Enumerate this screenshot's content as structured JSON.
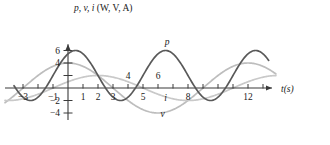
{
  "chart_data": {
    "type": "line",
    "title": "p, v, i (W, V, A)",
    "xlabel": "t(s)",
    "ylabel": "p, v, i (W, V, A)",
    "xlim": [
      -4,
      14
    ],
    "ylim": [
      -5.2,
      7.2
    ],
    "grid": false,
    "legend_position": "inline-curve-labels",
    "xticks": [
      -3,
      -2,
      -1,
      0,
      1,
      2,
      3,
      4,
      5,
      6,
      7,
      8,
      9,
      10,
      11,
      12,
      13
    ],
    "xticklabels_shown": [
      "-3",
      "-1",
      "1",
      "2",
      "3",
      "4",
      "5",
      "6",
      "8",
      "12"
    ],
    "yticks": [
      -4,
      -2,
      2,
      4,
      6
    ],
    "yticklabels_shown": [
      "6",
      "4",
      "-2",
      "-4"
    ],
    "series": [
      {
        "name": "p",
        "label": "p",
        "unit": "W",
        "color": "#595959",
        "style": "dark-solid",
        "form": "p = 2 + 4*sin(2*pi*(t+1)/6)",
        "amplitude": 4,
        "offset": 2,
        "period": 6,
        "zeros": [
          -3,
          -1,
          3,
          5,
          9,
          11
        ],
        "maxima": [
          {
            "t": 0.5,
            "value": 6
          },
          {
            "t": 6.5,
            "value": 6
          },
          {
            "t": 12.5,
            "value": 6
          }
        ],
        "minima": [
          {
            "t": -2.5,
            "value": -2
          },
          {
            "t": 3.5,
            "value": -2
          },
          {
            "t": 9.5,
            "value": -2
          }
        ],
        "label_pos": {
          "t": 6.6,
          "value": 6.9
        }
      },
      {
        "name": "v",
        "label": "v",
        "unit": "V",
        "color": "#bdbdbd",
        "style": "light-solid",
        "form": "v = 4*cos(2*pi*t/12)",
        "amplitude": 4,
        "offset": 0,
        "period": 12,
        "zeros": [
          -3,
          3,
          9
        ],
        "maxima": [
          {
            "t": 0,
            "value": 4
          },
          {
            "t": 12,
            "value": 4
          }
        ],
        "minima": [
          {
            "t": 6,
            "value": -4
          }
        ],
        "label_pos": {
          "t": 6.3,
          "value": -4.6
        }
      },
      {
        "name": "i",
        "label": "i",
        "unit": "A",
        "color": "#c9c9c9",
        "style": "light-solid",
        "form": "i = 2*sin(2*pi*(t+1)/12)",
        "amplitude": 2,
        "offset": 0,
        "period": 12,
        "zeros": [
          -1,
          5,
          11
        ],
        "maxima": [
          {
            "t": 2,
            "value": 2
          }
        ],
        "minima": [
          {
            "t": 8,
            "value": -2
          }
        ],
        "label_pos": {
          "t": 6.5,
          "value": -2.0
        }
      }
    ]
  },
  "axes": {
    "y_axis_title_parts": {
      "vars": "p, v, i",
      "units": "(W, V, A)"
    },
    "x_axis_title_parts": {
      "var": "t",
      "units": "(s)"
    }
  },
  "tick_labels": {
    "x": [
      {
        "value": -3,
        "text": "-3"
      },
      {
        "value": -1,
        "text": "-1"
      },
      {
        "value": 1,
        "text": "1"
      },
      {
        "value": 2,
        "text": "2"
      },
      {
        "value": 3,
        "text": "3"
      },
      {
        "value": 4,
        "text": "4"
      },
      {
        "value": 5,
        "text": "5"
      },
      {
        "value": 6,
        "text": "6"
      },
      {
        "value": 8,
        "text": "8"
      },
      {
        "value": 12,
        "text": "12"
      }
    ],
    "y": [
      {
        "value": 6,
        "text": "6"
      },
      {
        "value": 4,
        "text": "4"
      },
      {
        "value": -2,
        "text": "-2"
      },
      {
        "value": -4,
        "text": "-4"
      }
    ]
  },
  "colors": {
    "axis": "#3a3a3a",
    "p_curve": "#595959",
    "v_curve": "#bdbdbd",
    "i_curve": "#c9c9c9",
    "background": "#ffffff",
    "text": "#1a1a1a"
  }
}
